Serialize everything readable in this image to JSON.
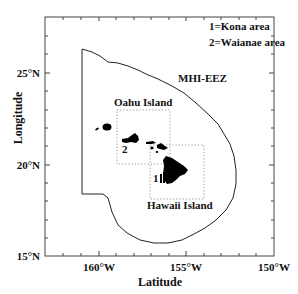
{
  "map": {
    "axis": {
      "x_label": "Latitude",
      "y_label": "Longitude",
      "x_ticks": [
        "160°W",
        "155°W",
        "150°W"
      ],
      "y_ticks": [
        "25°N",
        "20°N",
        "15°N"
      ]
    },
    "legend": {
      "line1": "1=Kona area",
      "line2": "2=Waianae area"
    },
    "labels": {
      "eez": "MHI-EEZ",
      "oahu": "Oahu Island",
      "hawaii": "Hawaii Island",
      "marker1": "1",
      "marker2": "2"
    },
    "colors": {
      "line": "#222222",
      "land": "#000000",
      "box": "#9a9a9a",
      "background": "#ffffff"
    }
  }
}
